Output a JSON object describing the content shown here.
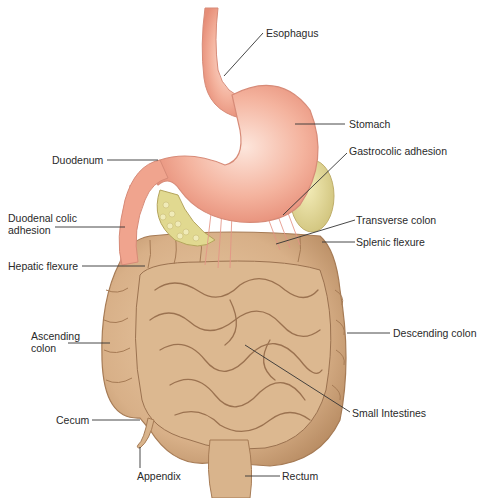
{
  "diagram": {
    "colors": {
      "stomach": "#f0a890",
      "stomach_light": "#fbe0d4",
      "intestine": "#d9b48c",
      "intestine_dark": "#a97e57",
      "pancreas_fat": "#e3dc9a",
      "spleen": "#e8df9e",
      "adhesion": "#e9958a",
      "leader_line": "#333333"
    },
    "labels": {
      "esophagus": "Esophagus",
      "stomach": "Stomach",
      "duodenum": "Duodenum",
      "gastrocolic_adhesion": "Gastrocolic adhesion",
      "duodenal_colic_adhesion_l1": "Duodenal colic",
      "duodenal_colic_adhesion_l2": "adhesion",
      "transverse_colon": "Transverse colon",
      "splenic_flexure": "Splenic flexure",
      "hepatic_flexure": "Hepatic flexure",
      "ascending_colon_l1": "Ascending",
      "ascending_colon_l2": "colon",
      "descending_colon": "Descending colon",
      "cecum": "Cecum",
      "small_intestines": "Small Intestines",
      "appendix": "Appendix",
      "rectum": "Rectum"
    }
  }
}
